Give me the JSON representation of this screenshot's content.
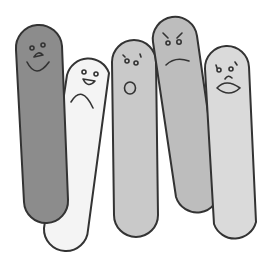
{
  "illustration": {
    "description": "Five cartoon popsicle-stick characters with different facial expressions",
    "background": "#ffffff",
    "outline_color": "#333333",
    "characters": [
      {
        "name": "happy",
        "expression": "smiling",
        "fill": "#8c8c8c"
      },
      {
        "name": "sad",
        "expression": "frowning",
        "fill": "#f4f4f4"
      },
      {
        "name": "surprised",
        "expression": "open mouth",
        "fill": "#c9c9c9"
      },
      {
        "name": "angry",
        "expression": "scowling",
        "fill": "#bdbdbd"
      },
      {
        "name": "worried",
        "expression": "pouting",
        "fill": "#dadada"
      }
    ]
  }
}
